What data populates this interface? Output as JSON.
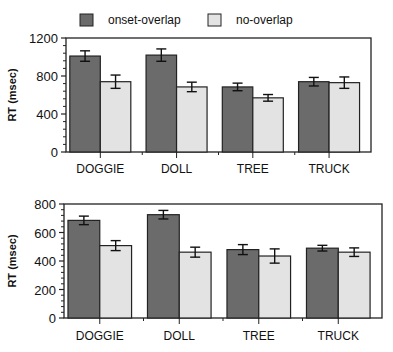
{
  "legend": {
    "items": [
      {
        "label": "onset-overlap",
        "color": "#6b6b6b"
      },
      {
        "label": "no-overlap",
        "color": "#e3e3e3"
      }
    ]
  },
  "chart_data": [
    {
      "type": "bar",
      "title": "",
      "xlabel": "",
      "ylabel": "RT (msec)",
      "ylim": [
        0,
        1200
      ],
      "yticks": [
        0,
        400,
        800,
        1200
      ],
      "categories": [
        "DOGGIE",
        "DOLL",
        "TREE",
        "TRUCK"
      ],
      "series": [
        {
          "name": "onset-overlap",
          "values": [
            1010,
            1020,
            685,
            740
          ],
          "errors": [
            55,
            65,
            40,
            45
          ]
        },
        {
          "name": "no-overlap",
          "values": [
            740,
            685,
            570,
            730
          ],
          "errors": [
            70,
            50,
            35,
            60
          ]
        }
      ],
      "grid": false,
      "legend_position": "top"
    },
    {
      "type": "bar",
      "title": "",
      "xlabel": "",
      "ylabel": "RT (msec)",
      "ylim": [
        0,
        800
      ],
      "yticks": [
        0,
        200,
        400,
        600,
        800
      ],
      "categories": [
        "DOGGIE",
        "DOLL",
        "TREE",
        "TRUCK"
      ],
      "series": [
        {
          "name": "onset-overlap",
          "values": [
            685,
            725,
            480,
            490
          ],
          "errors": [
            30,
            30,
            35,
            20
          ]
        },
        {
          "name": "no-overlap",
          "values": [
            508,
            462,
            435,
            462
          ],
          "errors": [
            35,
            35,
            50,
            30
          ]
        }
      ],
      "grid": false,
      "legend_position": "top"
    }
  ]
}
